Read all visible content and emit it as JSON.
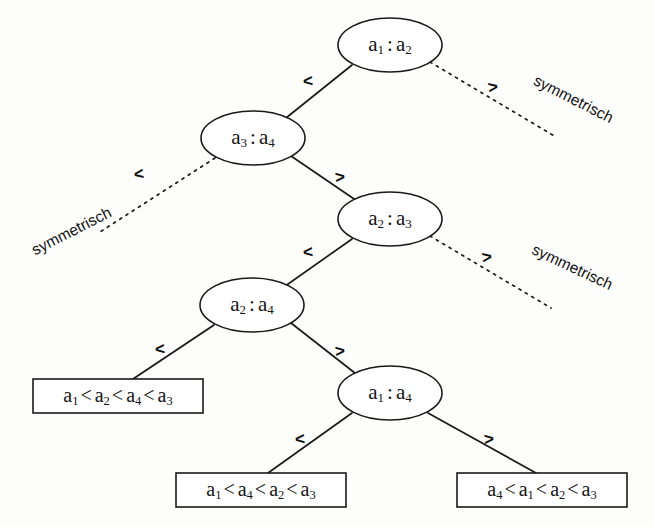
{
  "diagram": {
    "type": "decision-tree",
    "background_color": "#fdfdfc",
    "stroke_color": "#1a1a1a",
    "nodes": [
      {
        "id": "n1",
        "label_full": "a 1 : a 2",
        "left": "a",
        "left_sub": "1",
        "sep": ":",
        "right": "a",
        "right_sub": "2",
        "cx": 390,
        "cy": 45,
        "rx": 52,
        "ry": 27
      },
      {
        "id": "n2",
        "label_full": "a 3 : a 4",
        "left": "a",
        "left_sub": "3",
        "sep": ":",
        "right": "a",
        "right_sub": "4",
        "cx": 253,
        "cy": 138,
        "rx": 52,
        "ry": 27
      },
      {
        "id": "n3",
        "label_full": "a 2 : a 3",
        "left": "a",
        "left_sub": "2",
        "sep": ":",
        "right": "a",
        "right_sub": "3",
        "cx": 390,
        "cy": 219,
        "rx": 52,
        "ry": 27
      },
      {
        "id": "n4",
        "label_full": "a 2 : a 4",
        "left": "a",
        "left_sub": "2",
        "sep": ":",
        "right": "a",
        "right_sub": "4",
        "cx": 252,
        "cy": 305,
        "rx": 52,
        "ry": 27
      },
      {
        "id": "n5",
        "label_full": "a 1 : a 4",
        "left": "a",
        "left_sub": "1",
        "sep": ":",
        "right": "a",
        "right_sub": "4",
        "cx": 390,
        "cy": 393,
        "rx": 52,
        "ry": 27
      }
    ],
    "leaves": [
      {
        "id": "leaf1",
        "text": "a1 < a2 < a4 < a3",
        "order": [
          "1",
          "2",
          "4",
          "3"
        ],
        "x": 33,
        "y": 379,
        "w": 170,
        "h": 34
      },
      {
        "id": "leaf2",
        "text": "a1 < a4 < a2 < a3",
        "order": [
          "1",
          "4",
          "2",
          "3"
        ],
        "x": 176,
        "y": 473,
        "w": 170,
        "h": 34
      },
      {
        "id": "leaf3",
        "text": "a4 < a1 < a2 < a3",
        "order": [
          "4",
          "1",
          "2",
          "3"
        ],
        "x": 457,
        "y": 473,
        "w": 170,
        "h": 34
      }
    ],
    "edges": [
      {
        "id": "e1",
        "from": "n1",
        "to": "n2",
        "style": "solid",
        "label": "<",
        "label_x": 308,
        "label_y": 82,
        "label_rot": -5
      },
      {
        "id": "e2",
        "from": "n1",
        "to": "symmetrisch-1",
        "style": "dashed",
        "label": ">",
        "label_x": 493,
        "label_y": 88,
        "label_rot": -8
      },
      {
        "id": "e3",
        "from": "n2",
        "to": "symmetrisch-2",
        "style": "dashed",
        "label": "<",
        "label_x": 139,
        "label_y": 175,
        "label_rot": -8
      },
      {
        "id": "e4",
        "from": "n2",
        "to": "n3",
        "style": "solid",
        "label": ">",
        "label_x": 340,
        "label_y": 178,
        "label_rot": -5
      },
      {
        "id": "e5",
        "from": "n3",
        "to": "n4",
        "style": "solid",
        "label": "<",
        "label_x": 308,
        "label_y": 253,
        "label_rot": -5
      },
      {
        "id": "e6",
        "from": "n3",
        "to": "symmetrisch-3",
        "style": "dashed",
        "label": ">",
        "label_x": 487,
        "label_y": 258,
        "label_rot": -8
      },
      {
        "id": "e7",
        "from": "n4",
        "to": "leaf1",
        "style": "solid",
        "label": "<",
        "label_x": 160,
        "label_y": 350,
        "label_rot": -5
      },
      {
        "id": "e8",
        "from": "n4",
        "to": "n5",
        "style": "solid",
        "label": ">",
        "label_x": 340,
        "label_y": 352,
        "label_rot": -5
      },
      {
        "id": "e9",
        "from": "n5",
        "to": "leaf2",
        "style": "solid",
        "label": "<",
        "label_x": 300,
        "label_y": 440,
        "label_rot": -5
      },
      {
        "id": "e10",
        "from": "n5",
        "to": "leaf3",
        "style": "solid",
        "label": ">",
        "label_x": 489,
        "label_y": 440,
        "label_rot": -5
      }
    ],
    "annotations": [
      {
        "id": "symmetrisch-1",
        "text": "symmetrisch",
        "x": 573,
        "y": 100,
        "rotation": 27
      },
      {
        "id": "symmetrisch-2",
        "text": "symmetrisch",
        "x": 72,
        "y": 232,
        "rotation": -27
      },
      {
        "id": "symmetrisch-3",
        "text": "symmetrisch",
        "x": 572,
        "y": 268,
        "rotation": 25
      }
    ],
    "symbols": {
      "less_than": "<",
      "greater_than": ">",
      "colon": ":"
    }
  }
}
